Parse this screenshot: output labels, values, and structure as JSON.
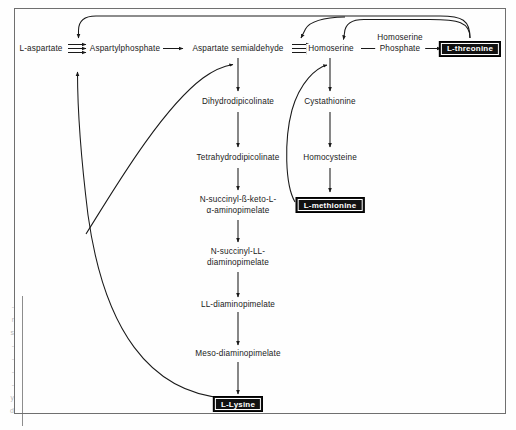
{
  "figure": {
    "frame": {
      "border_color": "#6f6f6f"
    },
    "background": "#fefefe",
    "ink_color": "#1a1a1a",
    "endproduct_box": {
      "fill": "#111111",
      "text_color": "#ffffff"
    }
  },
  "nodes": {
    "l_aspartate": "L-aspartate",
    "aspartylphosphate": "Aspartylphosphate",
    "aspartate_semialdehyde": "Aspartate semialdehyde",
    "homoserine": "Homoserine",
    "homoserine_phosphate_line1": "Homoserine",
    "homoserine_phosphate_line2": "Phosphate",
    "dihydrodipicolinate": "Dihydrodipicolinate",
    "tetrahydrodipicolinate": "Tetrahydrodipicolinate",
    "n_succinyl_keto_line1": "N-succinyl-ß-keto-L-",
    "n_succinyl_keto_line2": "α-aminopimelate",
    "n_succinyl_ll_line1": "N-succinyl-LL-",
    "n_succinyl_ll_line2": "diaminopimelate",
    "ll_diaminopimelate": "LL-diaminopimelate",
    "meso_diaminopimelate": "Meso-diaminopimelate",
    "cystathionine": "Cystathionine",
    "homocysteine": "Homocysteine"
  },
  "end_products": {
    "l_threonine": "L-threonine",
    "l_methionine": "L-methionine",
    "l_lysine": "L-Lysine"
  },
  "edge_artifacts": [
    "-",
    "r",
    "s",
    "-",
    "-",
    "-",
    "-",
    "y",
    "d"
  ]
}
